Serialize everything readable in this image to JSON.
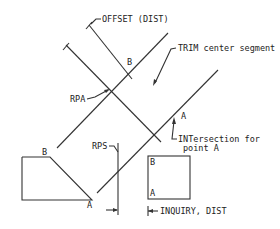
{
  "labels": {
    "offset": "OFFSET (DIST)",
    "trim": "TRIM center segment",
    "rpa": "RPA",
    "rps": "RPS",
    "b_upper": "B",
    "a_upper": "A",
    "intersection_line1": "INTersection for",
    "intersection_line2": "point A",
    "b_poly": "B",
    "a_poly": "A",
    "b_square": "B",
    "a_square": "A",
    "inquiry": "INQUIRY, DIST"
  },
  "colors": {
    "line": "#333333",
    "text": "#222222",
    "background": "#ffffff"
  }
}
